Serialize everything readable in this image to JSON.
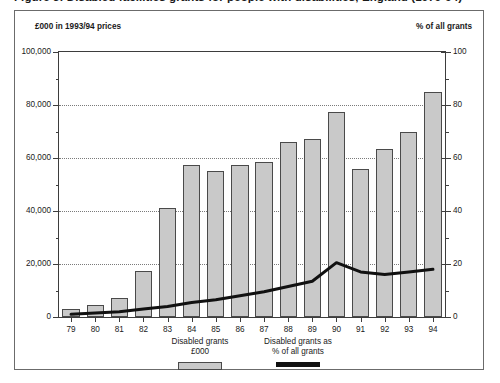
{
  "figure": {
    "title": "Figure 3: Disabled facilities grants for people with disabilities, England (1979-94)",
    "left_unit_caption": "£000 in 1993/94  prices",
    "right_unit_caption": "% of all grants"
  },
  "legend": [
    {
      "name": "bars-legend",
      "line1": "Disabled grants",
      "line2": "£000",
      "swatch": "bar-swatch",
      "color": "#c9c9c9"
    },
    {
      "name": "line-legend",
      "line1": "Disabled grants as",
      "line2": "% of all grants",
      "swatch": "line-swatch",
      "color": "#111111"
    }
  ],
  "chart_data": {
    "type": "bar",
    "title": "Figure 3: Disabled facilities grants for people with disabilities, England (1979-94)",
    "xlabel": "",
    "ylabel": "£000 in 1993/94  prices",
    "y2label": "% of all grants",
    "grid": true,
    "legend_position": "bottom-center",
    "categories": [
      "79",
      "80",
      "81",
      "82",
      "83",
      "84",
      "85",
      "86",
      "87",
      "88",
      "89",
      "90",
      "91",
      "92",
      "93",
      "94"
    ],
    "ylim": [
      0,
      100000
    ],
    "yticks": [
      0,
      20000,
      40000,
      60000,
      80000,
      100000
    ],
    "ytick_labels": [
      "0",
      "20,000",
      "40,000",
      "60,000",
      "80,000",
      "100,000"
    ],
    "yminor_ticks": [
      10000,
      30000,
      50000,
      70000,
      90000
    ],
    "y2lim": [
      0,
      100
    ],
    "y2ticks": [
      0,
      20,
      40,
      60,
      80,
      100
    ],
    "y2tick_labels": [
      "0",
      "20",
      "40",
      "60",
      "80",
      "100"
    ],
    "y2minor_ticks": [
      10,
      30,
      50,
      70,
      90
    ],
    "series": [
      {
        "name": "Disabled grants £000",
        "kind": "bar",
        "axis": "left",
        "color": "#c9c9c9",
        "edge_color": "#4a4a4a",
        "values": [
          3000,
          4500,
          7000,
          17500,
          41000,
          57500,
          55000,
          57500,
          58500,
          66000,
          67000,
          77500,
          56000,
          63500,
          70000,
          85000
        ]
      },
      {
        "name": "Disabled grants as % of all grants",
        "kind": "line",
        "axis": "right",
        "color": "#111111",
        "values": [
          1.0,
          1.5,
          2.0,
          3.0,
          4.0,
          5.5,
          6.5,
          8.0,
          9.5,
          11.5,
          13.5,
          20.5,
          17.0,
          16.0,
          17.0,
          18.0
        ]
      }
    ]
  }
}
